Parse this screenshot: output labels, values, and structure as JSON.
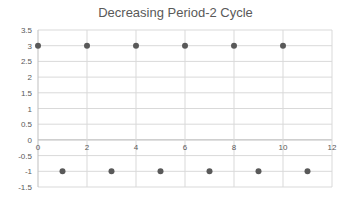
{
  "chart_data": {
    "type": "scatter",
    "title": "Decreasing Period-2 Cycle",
    "xlabel": "",
    "ylabel": "",
    "xlim": [
      0,
      12
    ],
    "ylim": [
      -1.5,
      3.5
    ],
    "x_ticks": [
      0,
      2,
      4,
      6,
      8,
      10,
      12
    ],
    "y_ticks": [
      3.5,
      3,
      2.5,
      2,
      1.5,
      1,
      0.5,
      0,
      -0.5,
      -1,
      -1.5
    ],
    "grid": true,
    "legend": null,
    "series": [
      {
        "name": "Series1",
        "x": [
          0,
          1,
          2,
          3,
          4,
          5,
          6,
          7,
          8,
          9,
          10,
          11
        ],
        "y": [
          3,
          -1,
          3,
          -1,
          3,
          -1,
          3,
          -1,
          3,
          -1,
          3,
          -1
        ],
        "color": "#595959"
      }
    ]
  },
  "colors": {
    "grid": "#d9d9d9",
    "axis": "#bfbfbf",
    "text": "#595959",
    "marker": "#595959"
  }
}
